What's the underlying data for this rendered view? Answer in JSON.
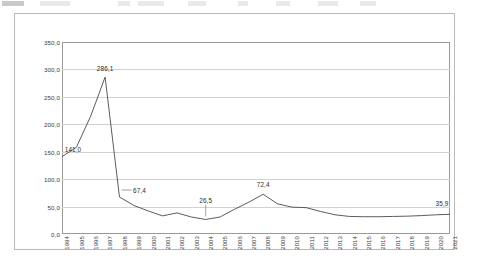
{
  "chart_data": {
    "type": "line",
    "title": "",
    "subtitle": "",
    "xlabel": "",
    "ylabel": "",
    "ylim": [
      0.0,
      350.0
    ],
    "ytick_step": 50.0,
    "ytick_labels": [
      "350,0",
      "300,0",
      "250,0",
      "200,0",
      "150,0",
      "100,0",
      "50,0",
      "0,0"
    ],
    "ytick_values": [
      350.0,
      300.0,
      250.0,
      200.0,
      150.0,
      100.0,
      50.0,
      0.0
    ],
    "grid": true,
    "legend": false,
    "legend_position": "none",
    "decimal_separator": ",",
    "line_color": "#4a4a4a",
    "grid_color": "#d2d2d2",
    "axis_color": "#9a9a9a",
    "categories": [
      "1994",
      "1995",
      "1996",
      "1997",
      "1998",
      "1999",
      "2000",
      "2001",
      "2002",
      "2003",
      "2004",
      "2005",
      "2006",
      "2007",
      "2008",
      "2009",
      "2010",
      "2011",
      "2012",
      "2013",
      "2014",
      "2015",
      "2016",
      "2017",
      "2018",
      "2019",
      "2020",
      "2021"
    ],
    "values": [
      141.0,
      158.0,
      215.0,
      286.1,
      67.4,
      52.0,
      42.0,
      33.0,
      38.5,
      31.0,
      26.5,
      31.0,
      45.0,
      58.0,
      72.4,
      55.0,
      49.0,
      48.0,
      41.0,
      35.0,
      32.0,
      31.5,
      31.5,
      32.0,
      32.5,
      33.5,
      35.0,
      35.9
    ],
    "series": [
      {
        "name": "series-1",
        "values": [
          141.0,
          158.0,
          215.0,
          286.1,
          67.4,
          52.0,
          42.0,
          33.0,
          38.5,
          31.0,
          26.5,
          31.0,
          45.0,
          58.0,
          72.4,
          55.0,
          49.0,
          48.0,
          41.0,
          35.0,
          32.0,
          31.5,
          31.5,
          32.0,
          32.5,
          33.5,
          35.0,
          35.9
        ]
      }
    ],
    "annotations": [
      {
        "name": "label-1994",
        "category": "1994",
        "value": 141.0,
        "text": "141,0",
        "leader": "none"
      },
      {
        "name": "label-1997-peak",
        "category": "1997",
        "value": 286.1,
        "text": "286,1",
        "leader": "none"
      },
      {
        "name": "label-1998",
        "category": "1998",
        "value": 67.4,
        "text": "67,4",
        "leader": "left"
      },
      {
        "name": "label-2004-min",
        "category": "2004",
        "value": 26.5,
        "text": "26,5",
        "leader": "down"
      },
      {
        "name": "label-2008",
        "category": "2008",
        "value": 72.4,
        "text": "72,4",
        "leader": "none"
      },
      {
        "name": "label-2021",
        "category": "2021",
        "value": 35.9,
        "text": "35,9",
        "leader": "none"
      }
    ]
  }
}
